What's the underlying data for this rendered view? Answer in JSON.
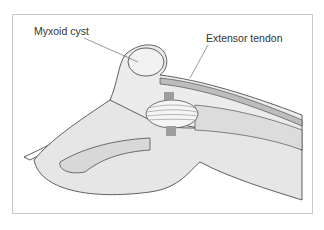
{
  "figure": {
    "labels": {
      "cyst": "Myxoid cyst",
      "tendon": "Extensor tendon"
    },
    "colors": {
      "skin": "#e6e6e6",
      "outline": "#3a3a3a",
      "tendon": "#bdbdbd",
      "cartilage": "#9e9e9e",
      "frame": "#c8c8c8"
    }
  }
}
